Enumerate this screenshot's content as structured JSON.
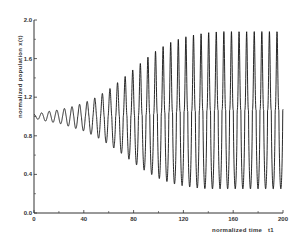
{
  "chart_data": {
    "type": "line",
    "title": "",
    "xlabel": "normalized time",
    "xlabel_symbol": "t1",
    "ylabel": "normalized population x(t)",
    "xlim": [
      0,
      200
    ],
    "ylim": [
      0.0,
      2.0
    ],
    "x_ticks": [
      0,
      40,
      80,
      120,
      160,
      200
    ],
    "x_tick_labels": [
      "0",
      "40",
      "80",
      "120",
      "160",
      "200"
    ],
    "y_ticks": [
      0.0,
      0.4,
      0.8,
      1.2,
      1.6,
      2.0
    ],
    "y_tick_labels": [
      "0.0",
      "0.4",
      "0.8",
      "1.2",
      "1.6",
      "2.0"
    ],
    "grid": false,
    "legend": null,
    "series": [
      {
        "name": "x(t)",
        "description": "Growing oscillation around 1.0 that saturates into a limit cycle",
        "start_value": 1.0,
        "period": 6.1,
        "envelope": {
          "t": [
            0,
            10,
            20,
            30,
            40,
            50,
            60,
            70,
            80,
            90,
            100,
            110,
            120,
            130,
            140,
            150,
            160,
            170,
            180,
            190,
            200
          ],
          "max": [
            1.02,
            1.05,
            1.07,
            1.1,
            1.14,
            1.2,
            1.28,
            1.38,
            1.49,
            1.6,
            1.7,
            1.77,
            1.82,
            1.85,
            1.87,
            1.88,
            1.88,
            1.88,
            1.88,
            1.88,
            1.88
          ],
          "min": [
            0.98,
            0.95,
            0.93,
            0.89,
            0.85,
            0.79,
            0.71,
            0.62,
            0.52,
            0.43,
            0.36,
            0.31,
            0.28,
            0.26,
            0.25,
            0.25,
            0.25,
            0.25,
            0.25,
            0.25,
            0.25
          ]
        }
      }
    ]
  }
}
